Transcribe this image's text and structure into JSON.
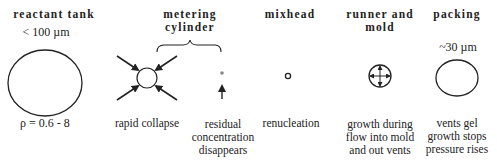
{
  "stages": [
    {
      "id": "reactant-tank",
      "heading": "reactant tank",
      "size_note": "< 100 µm",
      "density_note": "ρ = 0.6 - 8"
    },
    {
      "id": "metering-cylinder",
      "heading_line1": "metering",
      "heading_line2": "cylinder",
      "sub_captions": [
        "rapid collapse",
        "residual",
        "concentration",
        "disappears"
      ]
    },
    {
      "id": "mixhead",
      "heading": "mixhead",
      "caption": "renucleation"
    },
    {
      "id": "runner-and-mold",
      "heading_line1": "runner and",
      "heading_line2": "mold",
      "caption_lines": [
        "growth during",
        "flow into mold",
        "and out vents"
      ]
    },
    {
      "id": "packing",
      "heading": "packing",
      "size_note": "~30 µm",
      "caption_lines": [
        "vents gel",
        "growth stops",
        "pressure rises"
      ]
    }
  ],
  "colors": {
    "ink": "#222222",
    "background": "#ffffff",
    "dot": "#888888"
  }
}
